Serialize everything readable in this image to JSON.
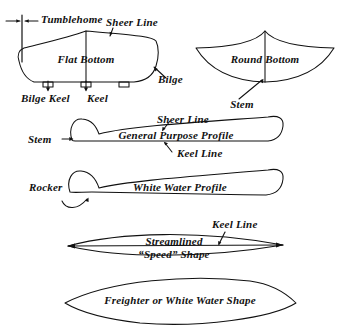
{
  "figure": {
    "kind": "line-diagram",
    "ink_color": "#111111",
    "background_color": "#ffffff"
  },
  "cross_sections": {
    "flat_bottom": {
      "title": "Flat Bottom",
      "annotations": {
        "tumblehome": "Tumblehome",
        "sheer_line": "Sheer Line",
        "bilge": "Bilge",
        "bilge_keel": "Bilge Keel",
        "keel": "Keel"
      }
    },
    "round_bottom": {
      "title": "Round Bottom",
      "annotations": {
        "stem": "Stem"
      }
    }
  },
  "side_profiles": {
    "general_purpose": {
      "title": "General Purpose Profile",
      "annotations": {
        "sheer_line": "Sheer Line",
        "keel_line": "Keel Line",
        "stem": "Stem"
      }
    },
    "white_water": {
      "title": "White Water Profile",
      "annotations": {
        "rocker": "Rocker"
      }
    }
  },
  "plan_views": {
    "speed": {
      "title_line1": "Streamlined",
      "title_line2": "“Speed” Shape",
      "annotations": {
        "keel_line": "Keel Line"
      }
    },
    "freighter": {
      "title": "Freighter or White Water Shape"
    }
  }
}
